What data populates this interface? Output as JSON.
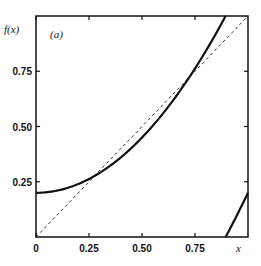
{
  "chart_data": {
    "type": "line",
    "title": "",
    "panel_label": "(a)",
    "xlabel": "x",
    "ylabel": "f(x)",
    "xlim": [
      0,
      1
    ],
    "ylim": [
      0,
      1
    ],
    "grid": false,
    "legend": null,
    "x_ticks": [
      0,
      0.25,
      0.5,
      0.75
    ],
    "x_tick_labels": [
      "0",
      "0.25",
      "0.50",
      "0.75"
    ],
    "y_ticks": [
      0.25,
      0.5,
      0.75
    ],
    "y_tick_labels": [
      "0.25",
      "0.50",
      "0.75"
    ],
    "series": [
      {
        "name": "f(x) = (0.2 + x^2) mod 1",
        "style": "solid",
        "segments": [
          {
            "x": [
              0,
              0.1,
              0.2,
              0.25,
              0.3,
              0.4,
              0.5,
              0.6,
              0.7,
              0.8,
              0.894
            ],
            "y": [
              0.2,
              0.21,
              0.24,
              0.2625,
              0.29,
              0.36,
              0.45,
              0.56,
              0.69,
              0.84,
              1.0
            ]
          },
          {
            "x": [
              0.894,
              0.95,
              1.0
            ],
            "y": [
              0.0,
              0.1025,
              0.2
            ]
          }
        ]
      },
      {
        "name": "identity y = x",
        "style": "dashed",
        "x": [
          0,
          1
        ],
        "y": [
          0,
          1
        ]
      }
    ]
  }
}
